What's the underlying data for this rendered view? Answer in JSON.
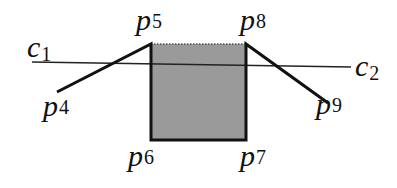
{
  "diagram": {
    "type": "geometric-figure",
    "colors": {
      "background": "#ffffff",
      "stroke": "#111111",
      "fill": "#9a9a9a",
      "dotted_edge": "#555555"
    },
    "line_c": {
      "start_label": {
        "base": "c",
        "sub": "1"
      },
      "end_label": {
        "base": "c",
        "sub": "2"
      }
    },
    "points": {
      "p4": {
        "base": "p",
        "sub": "4"
      },
      "p5": {
        "base": "p",
        "sub": "5"
      },
      "p6": {
        "base": "p",
        "sub": "6"
      },
      "p7": {
        "base": "p",
        "sub": "7"
      },
      "p8": {
        "base": "p",
        "sub": "8"
      },
      "p9": {
        "base": "p",
        "sub": "9"
      }
    },
    "shaded_region": "rectangle p5-p8-p7-p6",
    "segments": [
      "p4-p5",
      "p5-p6",
      "p6-p7",
      "p7-p8",
      "p8-p9",
      "p5-p8 (dotted)",
      "c1-c2"
    ]
  }
}
